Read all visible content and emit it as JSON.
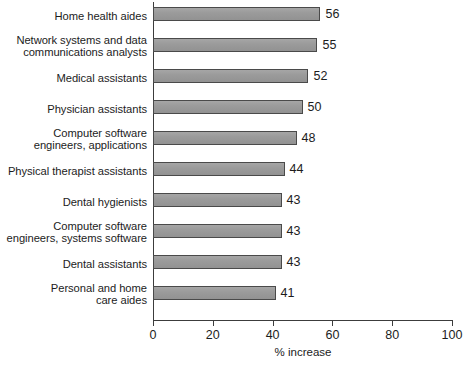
{
  "chart_data": {
    "type": "bar",
    "orientation": "horizontal",
    "title": "",
    "xlabel": "% increase",
    "ylabel": "",
    "xlim": [
      0,
      100
    ],
    "xticks": [
      0,
      20,
      40,
      60,
      80,
      100
    ],
    "grid": false,
    "legend": null,
    "categories": [
      "Home health aides",
      "Network systems and data\ncommunications analysts",
      "Medical assistants",
      "Physician assistants",
      "Computer software\nengineers, applications",
      "Physical therapist assistants",
      "Dental hygienists",
      "Computer software\nengineers, systems software",
      "Dental assistants",
      "Personal and home\ncare aides"
    ],
    "values": [
      56,
      55,
      52,
      50,
      48,
      44,
      43,
      43,
      43,
      41
    ],
    "value_labels": [
      "56",
      "55",
      "52",
      "50",
      "48",
      "44",
      "43",
      "43",
      "43",
      "41"
    ],
    "bar_color": "#9b9b9b",
    "bar_border_color": "#4a4a4a",
    "axis_color": "#3c3c3c",
    "background": "#ffffff"
  },
  "axis": {
    "tick_labels": [
      "0",
      "20",
      "40",
      "60",
      "80",
      "100"
    ],
    "title": "% increase"
  }
}
